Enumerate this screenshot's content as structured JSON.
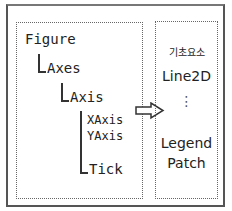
{
  "diagram": {
    "hierarchy": {
      "figure": "Figure",
      "axes": "Axes",
      "axis": "Axis",
      "xaxis": "XAxis",
      "yaxis": "YAxis",
      "tick": "Tick"
    },
    "primitives": {
      "title": "기초요소",
      "line2d": "Line2D",
      "ellipsis": "⋮",
      "legend": "Legend",
      "patch": "Patch"
    },
    "colors": {
      "border": "#555555",
      "dotted": "#666666",
      "text": "#222222"
    }
  }
}
